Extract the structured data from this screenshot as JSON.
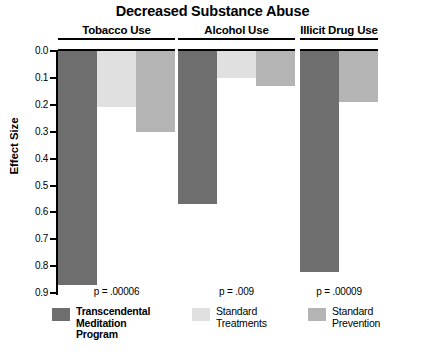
{
  "chart_data": {
    "type": "bar",
    "title": "Decreased Substance Abuse",
    "xlabel": "",
    "ylabel": "Effect Size",
    "ylim": [
      0.0,
      0.9
    ],
    "y_inverted": true,
    "grid": false,
    "legend_position": "bottom",
    "y_ticks": [
      "0.0",
      "0.1",
      "0.2",
      "0.3",
      "0.4",
      "0.5",
      "0.6",
      "0.7",
      "0.8",
      "0.9"
    ],
    "y_tick_values": [
      0.0,
      0.1,
      0.2,
      0.3,
      0.4,
      0.5,
      0.6,
      0.7,
      0.8,
      0.9
    ],
    "categories": [
      "Tobacco Use",
      "Alcohol Use",
      "Illicit Drug Use"
    ],
    "series": [
      {
        "name": "Transcendental Meditation Program",
        "color": "#6e6e6e",
        "values": [
          0.87,
          0.57,
          0.82
        ]
      },
      {
        "name": "Standard Treatments",
        "color": "#e0e0e0",
        "values": [
          0.21,
          0.1,
          null
        ]
      },
      {
        "name": "Standard Prevention",
        "color": "#b4b4b4",
        "values": [
          0.3,
          0.13,
          0.19
        ]
      }
    ],
    "annotations": [
      {
        "text": "p = .00006",
        "group": "Tobacco Use"
      },
      {
        "text": "p = .009",
        "group": "Alcohol Use"
      },
      {
        "text": "p = .00009",
        "group": "Illicit Drug Use"
      }
    ]
  },
  "groups": [
    {
      "label": "Tobacco Use",
      "pvalue": "p = .00006"
    },
    {
      "label": "Alcohol Use",
      "pvalue": "p = .009"
    },
    {
      "label": "Illicit Drug Use",
      "pvalue": "p = .00009"
    }
  ],
  "legend": [
    {
      "label": "Transcendental\nMeditation\nProgram",
      "color": "#6e6e6e",
      "bold": true
    },
    {
      "label": "Standard\nTreatments",
      "color": "#e0e0e0",
      "bold": false
    },
    {
      "label": "Standard\nPrevention",
      "color": "#b4b4b4",
      "bold": false
    }
  ],
  "footer": {
    "partial_text": ""
  }
}
